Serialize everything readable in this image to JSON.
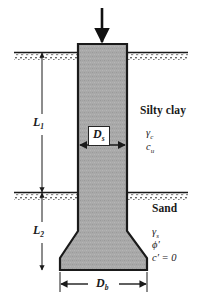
{
  "figure": {
    "background_color": "#ffffff",
    "line_color": "#1a1a1a",
    "shaft_fill_color": "#a8a8a8"
  },
  "load": {
    "icon": "down-arrow-icon",
    "direction": "down"
  },
  "soil_layers": [
    {
      "name": "Silty clay",
      "params": [
        {
          "symbol": "γ",
          "subscript": "c"
        },
        {
          "symbol": "c",
          "subscript": "u"
        }
      ],
      "surface_label": "ground-surface-hatch"
    },
    {
      "name": "Sand",
      "params": [
        {
          "symbol": "γ",
          "subscript": "s"
        },
        {
          "symbol": "ϕ′",
          "subscript": ""
        },
        {
          "symbol": "c′ = 0",
          "subscript": ""
        }
      ],
      "surface_label": "layer-interface-hatch"
    }
  ],
  "dimensions": {
    "length_top": {
      "symbol": "L",
      "subscript": "1"
    },
    "length_bottom": {
      "symbol": "L",
      "subscript": "2"
    },
    "shaft_diameter": {
      "symbol": "D",
      "subscript": "s"
    },
    "base_diameter": {
      "symbol": "D",
      "subscript": "b"
    }
  },
  "text": {
    "clay_name": "Silty clay",
    "clay_gamma": "γ",
    "clay_gamma_sub": "c",
    "clay_c": "c",
    "clay_c_sub": "u",
    "sand_name": "Sand",
    "sand_gamma": "γ",
    "sand_gamma_sub": "s",
    "sand_phi": "ϕ′",
    "sand_cohesion": "c′ = 0",
    "L1": "L",
    "L1_sub": "1",
    "L2": "L",
    "L2_sub": "2",
    "Ds": "D",
    "Ds_sub": "s",
    "Db": "D",
    "Db_sub": "b"
  }
}
